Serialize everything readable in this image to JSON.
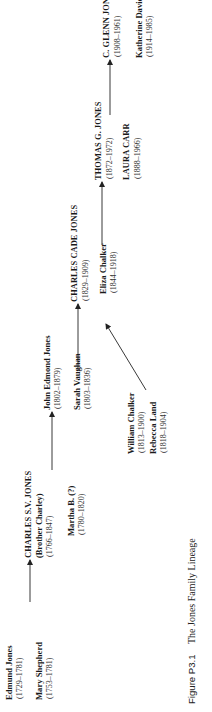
{
  "diagram": {
    "type": "family-lineage",
    "orientation": "rotated-90-ccw",
    "generations": [
      {
        "index": 1,
        "people": [
          {
            "name": "Edmund Jones",
            "dates": "(1729–1781)",
            "style": "bold"
          },
          {
            "name": "Mary Shepherd",
            "dates": "(1753–1781)",
            "style": "bold"
          }
        ]
      },
      {
        "index": 2,
        "people": [
          {
            "name": "CHARLES S.V. JONES",
            "nickname": "(Brother Charley)",
            "dates": "(1766–1847)",
            "style": "bold-caps"
          },
          {
            "name": "Martha B. (?)",
            "dates": "(1780–1820)",
            "style": "bold"
          }
        ]
      },
      {
        "index": 3,
        "people": [
          {
            "name": "John Edmond Jones",
            "dates": "(1802–1879)",
            "style": "bold"
          },
          {
            "name": "Sarah Vaughan",
            "dates": "(1803–1836)",
            "style": "bold"
          }
        ]
      },
      {
        "index": 4,
        "people": [
          {
            "name": "CHARLES CADE JONES",
            "dates": "(1829–1909)",
            "style": "bold-caps"
          },
          {
            "name": "Eliza Chalker",
            "dates": "(1844–1918)",
            "style": "bold"
          }
        ],
        "in_laws": [
          {
            "name": "William Chalker",
            "dates": "(1813–1900)",
            "style": "bold"
          },
          {
            "name": "Rebecca Land",
            "dates": "(1818–1904)",
            "style": "bold"
          }
        ]
      },
      {
        "index": 5,
        "people": [
          {
            "name": "THOMAS G. JONES",
            "dates": "(1872–1972)",
            "style": "bold-caps"
          },
          {
            "name": "LAURA CARR",
            "dates": "(1888–1966)",
            "style": "bold-caps"
          }
        ]
      },
      {
        "index": 6,
        "people": [
          {
            "name": "C. GLENN JONES",
            "dates": "(1908–1961)",
            "style": "bold-caps"
          },
          {
            "name": "Katherine Davidson",
            "dates": "(1914–1985)",
            "style": "bold"
          }
        ]
      }
    ],
    "edges": [
      {
        "from": "Edmund Jones & Mary Shepherd",
        "to": "CHARLES S.V. JONES"
      },
      {
        "from": "CHARLES S.V. JONES & Martha B. (?)",
        "to": "John Edmond Jones"
      },
      {
        "from": "John Edmond Jones & Sarah Vaughan",
        "to": "CHARLES CADE JONES"
      },
      {
        "from": "William Chalker & Rebecca Land",
        "to": "Eliza Chalker"
      },
      {
        "from": "CHARLES CADE JONES & Eliza Chalker",
        "to": "THOMAS G. JONES"
      },
      {
        "from": "THOMAS G. JONES & LAURA CARR",
        "to": "C. GLENN JONES"
      }
    ],
    "colors": {
      "text": "#1a1a1a",
      "lines": "#222222",
      "background": "#ffffff"
    }
  },
  "caption": {
    "label": "Figure P3.1",
    "text": "The Jones Family Lineage"
  }
}
